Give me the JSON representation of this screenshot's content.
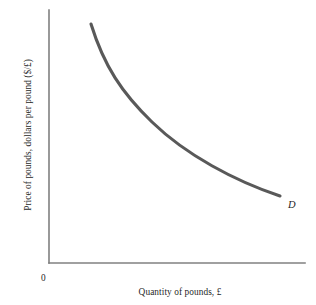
{
  "figure": {
    "background_color": "#ffffff",
    "width": 316,
    "height": 305
  },
  "labels": {
    "y_axis": "Price of pounds, dollars per pound ($/£)",
    "x_axis": "Quantity of pounds, £",
    "origin": "0",
    "curve": "D"
  },
  "colors": {
    "axis": "#808080",
    "curve": "#595959",
    "text": "#1f1f1f",
    "background": "#ffffff"
  },
  "chart_data": {
    "type": "line",
    "title": "",
    "subtitle": "",
    "xlabel": "Quantity of pounds, £",
    "ylabel": "Price of pounds, dollars per pound ($/£)",
    "grid": false,
    "legend": null,
    "xlim": [
      0,
      100
    ],
    "ylim": [
      0,
      100
    ],
    "x_ticks": [],
    "y_ticks": [],
    "annotations": [
      {
        "text": "D",
        "x": 93,
        "y": 26,
        "style": "italic"
      },
      {
        "text": "0",
        "x": 0,
        "y": 0,
        "style": "origin"
      }
    ],
    "series": [
      {
        "name": "D",
        "label": "Demand for pounds",
        "color": "#595959",
        "linewidth": 3.1,
        "shape": "convex-decreasing",
        "x": [
          16,
          22,
          28,
          34,
          40,
          46,
          52,
          58,
          64,
          70,
          76,
          82,
          88,
          90
        ],
        "y": [
          94,
          82,
          72,
          64,
          57,
          51,
          46,
          41,
          37,
          33,
          30,
          27,
          24,
          23
        ]
      }
    ]
  },
  "curve_geometry": {
    "path": "M 91 24 C 104 66, 122 93, 152 122 C 186 155, 235 181, 280 196",
    "axis_x": "M 49 263 L 305 263",
    "axis_y": "M 49 10 L 49 263"
  }
}
